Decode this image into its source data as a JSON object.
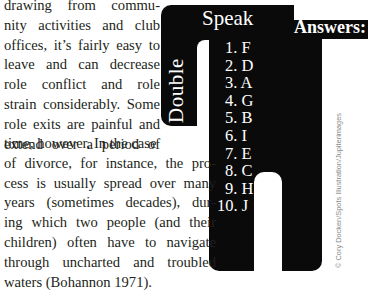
{
  "article": {
    "narrow_lines": [
      "drawing from commu-",
      "nity activities and club",
      "offices, it’s fairly easy to",
      "leave and can decrease",
      "role conflict and role",
      "strain considerably. Some",
      "role exits are painful and",
      "extend over a period of"
    ],
    "wide_lines": [
      "time, however. In the case",
      "of divorce, for instance, the pro-",
      "cess is usually spread over many",
      "years (sometimes decades), dur-",
      "ing which two people (and their",
      "children) often have to navigate",
      "through uncharted and troubled",
      "waters (Bohannon 1971)."
    ]
  },
  "sidebar": {
    "title_part1": "Double",
    "title_part2": "Speak",
    "answers_label": "Answers:",
    "answers": [
      "1. F",
      "2. D",
      "3. A",
      "4. G",
      "5. B",
      "6. I",
      "7. E",
      "8. C",
      "9. H",
      "10. J"
    ],
    "credit": "© Cory Docken/Spots Illustration/Jupiterimages"
  }
}
